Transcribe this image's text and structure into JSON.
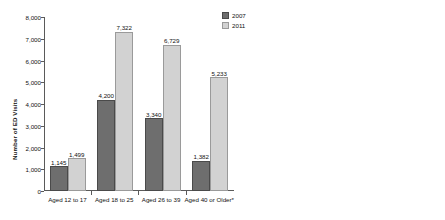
{
  "chart_data": [
    {
      "type": "bar",
      "id": "by-age-group",
      "title": "",
      "xlabel": "",
      "ylabel": "Number of ED Visits",
      "ylim": [
        0,
        8000
      ],
      "ytick_labels": [
        "8,000",
        "7,000",
        "6,000",
        "5,000",
        "4,000",
        "3,000",
        "2,000",
        "1,000",
        "0"
      ],
      "ytick_values": [
        8000,
        7000,
        6000,
        5000,
        4000,
        3000,
        2000,
        1000,
        0
      ],
      "grid": false,
      "legend_position": "top-right",
      "categories": [
        "Aged 12 to 17",
        "Aged 18 to 25",
        "Aged 26 to 39",
        "Aged 40 or Older*"
      ],
      "series": [
        {
          "name": "2007",
          "color": "#6e6e6e",
          "values": [
            1145,
            4200,
            3340,
            1382
          ],
          "labels": [
            "1,145",
            "4,200",
            "3,340",
            "1,382"
          ]
        },
        {
          "name": "2011",
          "color": "#d2d2d2",
          "values": [
            1499,
            7322,
            6729,
            5233
          ],
          "labels": [
            "1,499",
            "7,322",
            "6,729",
            "5,233"
          ]
        }
      ]
    },
    {
      "type": "bar",
      "id": "by-sex",
      "title": "",
      "xlabel": "",
      "ylabel": "Number of ED Visits",
      "ylim": [
        0,
        16000
      ],
      "ytick_labels": [
        "16,000",
        "14,000",
        "12,000",
        "10,000",
        "8,000",
        "6,000",
        "4,000",
        "2,000",
        "0"
      ],
      "ytick_values": [
        16000,
        14000,
        12000,
        10000,
        8000,
        6000,
        4000,
        2000,
        0
      ],
      "grid": false,
      "legend_position": "top-right",
      "categories": [
        "Male*",
        "Female*"
      ],
      "series": [
        {
          "name": "2007",
          "color": "#6e6e6e",
          "values": [
            7210,
            2854
          ],
          "labels": [
            "7,210",
            "2,854"
          ]
        },
        {
          "name": "2011",
          "color": "#d2d2d2",
          "values": [
            14905,
            5878
          ],
          "labels": [
            "14,905",
            "5,878"
          ]
        }
      ]
    }
  ]
}
